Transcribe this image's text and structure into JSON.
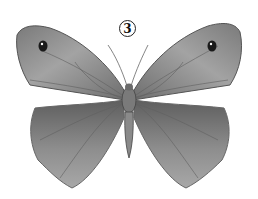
{
  "figure": {
    "label_number": "3",
    "style": "pencil / graphite drawing, dorsal view",
    "colors": {
      "background": "#ffffff",
      "wing_mid": "#8a8a8a",
      "wing_dark": "#5a5a5a",
      "wing_light": "#b5b5b5",
      "eyespot": "#1a1a1a"
    }
  }
}
